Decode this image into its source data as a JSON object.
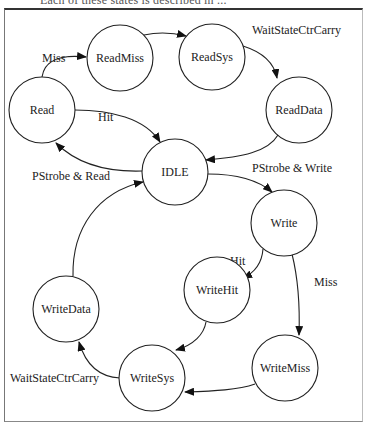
{
  "caption": "Each of these states is described in ...",
  "diagram": {
    "type": "state-machine",
    "nodes": [
      {
        "id": "read",
        "label": "Read",
        "cx": 42,
        "cy": 110
      },
      {
        "id": "readmiss",
        "label": "ReadMiss",
        "cx": 120,
        "cy": 58
      },
      {
        "id": "readsys",
        "label": "ReadSys",
        "cx": 212,
        "cy": 57
      },
      {
        "id": "readdata",
        "label": "ReadData",
        "cx": 299,
        "cy": 110
      },
      {
        "id": "idle",
        "label": "IDLE",
        "cx": 175,
        "cy": 172
      },
      {
        "id": "write",
        "label": "Write",
        "cx": 284,
        "cy": 223
      },
      {
        "id": "writehit",
        "label": "WriteHit",
        "cx": 217,
        "cy": 290
      },
      {
        "id": "writedata",
        "label": "WriteData",
        "cx": 66,
        "cy": 309
      },
      {
        "id": "writemiss",
        "label": "WriteMiss",
        "cx": 285,
        "cy": 368
      },
      {
        "id": "writesys",
        "label": "WriteSys",
        "cx": 152,
        "cy": 378
      }
    ],
    "edges": [
      {
        "from": "read",
        "to": "readmiss",
        "label": "Miss"
      },
      {
        "from": "readmiss",
        "to": "readsys",
        "label": ""
      },
      {
        "from": "readsys",
        "to": "readdata",
        "label": "WaitStateCtrCarry"
      },
      {
        "from": "readdata",
        "to": "idle",
        "label": ""
      },
      {
        "from": "read",
        "to": "idle",
        "label": "Hit"
      },
      {
        "from": "idle",
        "to": "read",
        "label": "PStrobe & Read"
      },
      {
        "from": "idle",
        "to": "write",
        "label": "PStrobe & Write"
      },
      {
        "from": "write",
        "to": "writehit",
        "label": "Hit"
      },
      {
        "from": "write",
        "to": "writemiss",
        "label": "Miss"
      },
      {
        "from": "writehit",
        "to": "writesys",
        "label": ""
      },
      {
        "from": "writemiss",
        "to": "writesys",
        "label": ""
      },
      {
        "from": "writesys",
        "to": "writedata",
        "label": "WaitStateCtrCarry"
      },
      {
        "from": "writedata",
        "to": "idle",
        "label": ""
      }
    ]
  },
  "edge_labels": {
    "read_miss": "Miss",
    "readsys_wait": "WaitStateCtrCarry",
    "read_hit": "Hit",
    "idle_read": "PStrobe & Read",
    "idle_write": "PStrobe & Write",
    "write_hit": "Hit",
    "write_miss": "Miss",
    "writesys_wait": "WaitStateCtrCarry"
  }
}
